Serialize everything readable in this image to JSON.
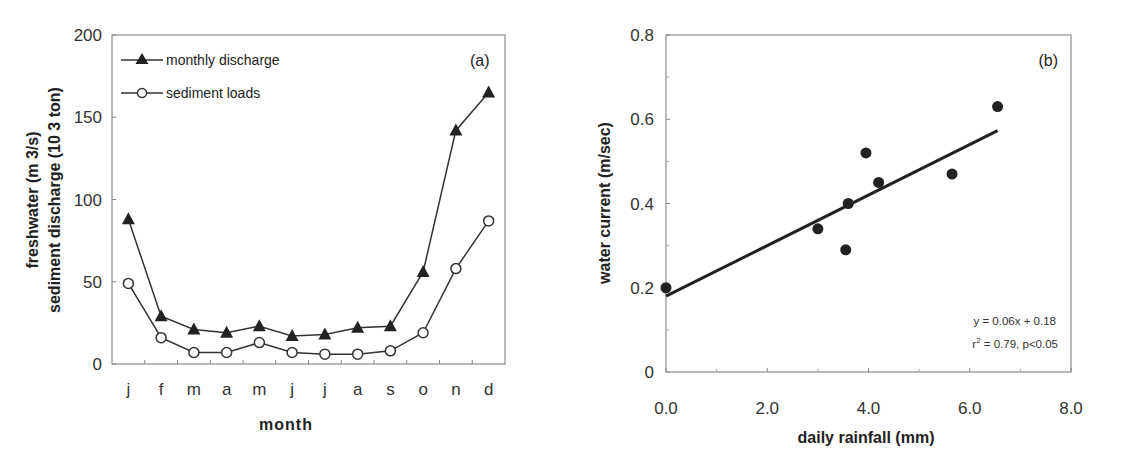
{
  "chart_data": [
    {
      "type": "line",
      "panel_label": "(a)",
      "title": "",
      "xlabel": "month",
      "ylabel_line1": "freshwater (m 3/s)",
      "ylabel_line2": "sediment discharge (10 3 ton)",
      "categories": [
        "j",
        "f",
        "m",
        "a",
        "m",
        "j",
        "j",
        "a",
        "s",
        "o",
        "n",
        "d"
      ],
      "yticks": [
        "0",
        "50",
        "100",
        "150",
        "200"
      ],
      "ylim": [
        0,
        200
      ],
      "grid": false,
      "legend_position": "upper-left",
      "series": [
        {
          "name": "monthly discharge",
          "marker": "filled-triangle",
          "values": [
            88,
            29,
            21,
            19,
            23,
            17,
            18,
            22,
            23,
            56,
            142,
            165
          ]
        },
        {
          "name": "sediment loads",
          "marker": "open-circle",
          "values": [
            49,
            16,
            7,
            7,
            13,
            7,
            6,
            6,
            8,
            19,
            58,
            87
          ]
        }
      ]
    },
    {
      "type": "scatter",
      "panel_label": "(b)",
      "title": "",
      "xlabel": "daily rainfall (mm)",
      "ylabel": "water current (m/sec)",
      "xticks": [
        "0.0",
        "2.0",
        "4.0",
        "6.0",
        "8.0"
      ],
      "yticks": [
        "0",
        "0.2",
        "0.4",
        "0.6",
        "0.8"
      ],
      "xlim": [
        0,
        8
      ],
      "ylim": [
        0,
        0.8
      ],
      "grid": false,
      "points": [
        {
          "x": 0.0,
          "y": 0.2
        },
        {
          "x": 3.0,
          "y": 0.34
        },
        {
          "x": 3.55,
          "y": 0.29
        },
        {
          "x": 3.6,
          "y": 0.4
        },
        {
          "x": 3.95,
          "y": 0.52
        },
        {
          "x": 4.2,
          "y": 0.45
        },
        {
          "x": 5.65,
          "y": 0.47
        },
        {
          "x": 6.55,
          "y": 0.63
        }
      ],
      "fit_line": {
        "slope": 0.06,
        "intercept": 0.18,
        "x_range": [
          0,
          6.55
        ]
      },
      "annotation_eq": "y = 0.06x + 0.18",
      "annotation_r2_prefix": "r",
      "annotation_r2_sup": "2",
      "annotation_r2_rest": " = 0.79, p<0.05"
    }
  ]
}
